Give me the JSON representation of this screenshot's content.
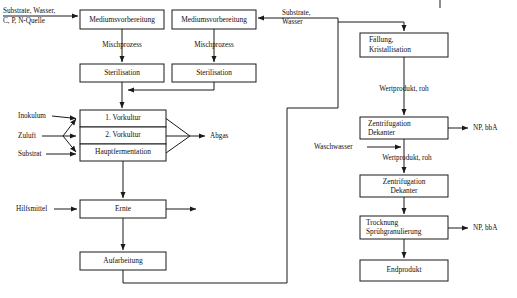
{
  "diagram": {
    "stroke_color": "#1a1a1a",
    "background_color": "#ffffff",
    "boxes": {
      "medium_prep_left": "Mediumsvorbereitung",
      "medium_prep_right": "Mediumsvorbereitung",
      "sterilisation_left": "Sterilisation",
      "sterilisation_right": "Sterilisation",
      "vorkultur_1": "1. Vorkultur",
      "vorkultur_2": "2. Vorkultur",
      "hauptfermentation": "Hauptfermentation",
      "ernte": "Ernte",
      "aufarbeitung": "Aufarbeitung",
      "faellung": {
        "line1": "Fällung,",
        "line2": "Kristallisation"
      },
      "zentrifugation_1": {
        "line1": "Zentrifugation",
        "line2": "Dekanter"
      },
      "zentrifugation_2": {
        "line1": "Zentrifugation",
        "line2": "Dekanter"
      },
      "trocknung": {
        "line1": "Trocknung",
        "line2": "Sprühgranulierung"
      },
      "endprodukt": "Endprodukt"
    },
    "flow_labels": {
      "input_top_left_line1": "Substrate, Wasser,",
      "input_top_left_line2": "C, P, N-Quelle",
      "input_top_right_line1": "Substrate,",
      "input_top_right_line2": "Wasser",
      "mischprozess_left": "Mischprozess",
      "mischprozess_right": "Mischprozess",
      "inokulum": "Inokulum",
      "zuluft": "Zuluft",
      "substrat": "Substrat",
      "abgas": "Abgas",
      "hilfsmittel": "Hilfsmittel",
      "wertprodukt_roh_1": "Wertprodukt, roh",
      "wertprodukt_roh_2": "Wertprodukt, roh",
      "waschwasser": "Waschwasser",
      "np_bba_1": "NP, bbA",
      "np_bba_2": "NP, bbA"
    }
  }
}
